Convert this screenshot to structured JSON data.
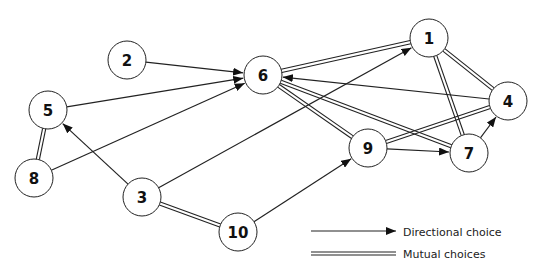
{
  "diagram": {
    "type": "sociogram",
    "node_radius": 19,
    "nodes": [
      {
        "id": "1",
        "label": "1",
        "x": 429,
        "y": 38
      },
      {
        "id": "2",
        "label": "2",
        "x": 127,
        "y": 60
      },
      {
        "id": "3",
        "label": "3",
        "x": 142,
        "y": 197
      },
      {
        "id": "4",
        "label": "4",
        "x": 508,
        "y": 101
      },
      {
        "id": "5",
        "label": "5",
        "x": 48,
        "y": 110
      },
      {
        "id": "6",
        "label": "6",
        "x": 263,
        "y": 75
      },
      {
        "id": "7",
        "label": "7",
        "x": 469,
        "y": 153
      },
      {
        "id": "8",
        "label": "8",
        "x": 34,
        "y": 178
      },
      {
        "id": "9",
        "label": "9",
        "x": 368,
        "y": 148
      },
      {
        "id": "10",
        "label": "10",
        "x": 238,
        "y": 232
      }
    ],
    "directional_edges": [
      {
        "from": "2",
        "to": "6"
      },
      {
        "from": "5",
        "to": "6"
      },
      {
        "from": "8",
        "to": "6"
      },
      {
        "from": "3",
        "to": "1"
      },
      {
        "from": "3",
        "to": "5"
      },
      {
        "from": "10",
        "to": "9"
      },
      {
        "from": "4",
        "to": "6"
      },
      {
        "from": "9",
        "to": "7"
      },
      {
        "from": "7",
        "to": "4"
      }
    ],
    "mutual_edges": [
      {
        "a": "6",
        "b": "1"
      },
      {
        "a": "6",
        "b": "9"
      },
      {
        "a": "6",
        "b": "7"
      },
      {
        "a": "1",
        "b": "4"
      },
      {
        "a": "1",
        "b": "7"
      },
      {
        "a": "9",
        "b": "4"
      },
      {
        "a": "5",
        "b": "8"
      },
      {
        "a": "3",
        "b": "10"
      }
    ],
    "colors": {
      "line": "#222222",
      "node_fill": "#ffffff",
      "text": "#111111"
    }
  },
  "legend": {
    "directional_label": "Directional choice",
    "mutual_label": "Mutual choices"
  }
}
